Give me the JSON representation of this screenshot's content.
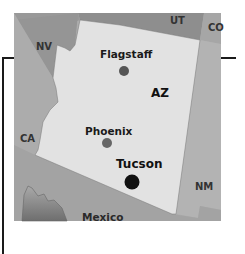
{
  "map": {
    "title": "Arizona",
    "states": [
      {
        "id": "az",
        "label": "AZ",
        "fill": "#e2e2e2"
      },
      {
        "id": "ut",
        "label": "UT",
        "fill": "#8e8e8e"
      },
      {
        "id": "co",
        "label": "CO",
        "fill": "#a6a6a6"
      },
      {
        "id": "nv",
        "label": "NV",
        "fill": "#959595"
      },
      {
        "id": "ca",
        "label": "CA",
        "fill": "#acacac"
      },
      {
        "id": "nm",
        "label": "NM",
        "fill": "#b3b3b3"
      },
      {
        "id": "mexico",
        "label": "Mexico",
        "fill": "#a3a3a3"
      }
    ],
    "cities": [
      {
        "id": "flagstaff",
        "label": "Flagstaff",
        "dot_color": "#555555",
        "emphasis": false
      },
      {
        "id": "phoenix",
        "label": "Phoenix",
        "dot_color": "#666666",
        "emphasis": false
      },
      {
        "id": "tucson",
        "label": "Tucson",
        "dot_color": "#111111",
        "emphasis": true
      }
    ],
    "colors": {
      "frame_line": "#1a1a1a",
      "gulf": "#8a8a8a"
    }
  }
}
